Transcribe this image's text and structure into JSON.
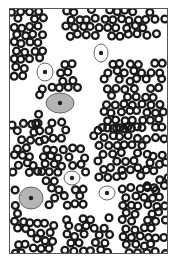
{
  "figure": {
    "colors": {
      "cell_ring": "#1a1a1a",
      "cell_center": "#ffffff",
      "epithelial_fill": "#b5b5b5",
      "epithelial_outline": "#666666",
      "nucleus": "#222222",
      "frame": "#555555"
    },
    "epithelial_cells": [
      {
        "x": 100,
        "y": 52,
        "rx": 7,
        "ry": 9,
        "fill": false
      },
      {
        "x": 44,
        "y": 71,
        "rx": 8,
        "ry": 9,
        "fill": false
      },
      {
        "x": 59,
        "y": 102,
        "rx": 14,
        "ry": 10,
        "fill": true
      },
      {
        "x": 71,
        "y": 177,
        "rx": 8,
        "ry": 7,
        "fill": false
      },
      {
        "x": 106,
        "y": 192,
        "rx": 8,
        "ry": 7,
        "fill": false
      },
      {
        "x": 30,
        "y": 197,
        "rx": 12,
        "ry": 11,
        "fill": true
      }
    ],
    "rbc_clusters": [
      {
        "x0": 2,
        "y0": 2,
        "x1": 36,
        "y1": 70
      },
      {
        "x0": 55,
        "y0": 2,
        "x1": 155,
        "y1": 32
      },
      {
        "x0": 25,
        "y0": 55,
        "x1": 70,
        "y1": 90
      },
      {
        "x0": 90,
        "y0": 55,
        "x1": 155,
        "y1": 125
      },
      {
        "x0": 25,
        "y0": 105,
        "x1": 55,
        "y1": 135
      },
      {
        "x0": 2,
        "y0": 115,
        "x1": 30,
        "y1": 165
      },
      {
        "x0": 30,
        "y0": 140,
        "x1": 75,
        "y1": 200
      },
      {
        "x0": 85,
        "y0": 120,
        "x1": 135,
        "y1": 175
      },
      {
        "x0": 135,
        "y0": 130,
        "x1": 158,
        "y1": 185
      },
      {
        "x0": 2,
        "y0": 180,
        "x1": 20,
        "y1": 245
      },
      {
        "x0": 15,
        "y0": 215,
        "x1": 45,
        "y1": 245
      },
      {
        "x0": 55,
        "y0": 210,
        "x1": 100,
        "y1": 245
      },
      {
        "x0": 110,
        "y0": 180,
        "x1": 155,
        "y1": 245
      }
    ]
  }
}
